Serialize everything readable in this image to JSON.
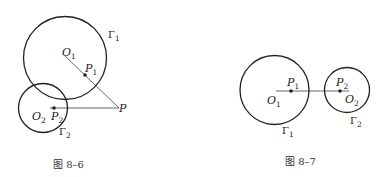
{
  "figures": [
    {
      "caption": "图 8–6",
      "labels": {
        "gamma1": "Γ",
        "gamma1_sub": "1",
        "gamma2": "Γ",
        "gamma2_sub": "2",
        "O1": "O",
        "O1_sub": "1",
        "P1": "P",
        "P1_sub": "1",
        "O2": "O",
        "O2_sub": "2",
        "P2": "P",
        "P2_sub": "2",
        "P": "P"
      }
    },
    {
      "caption": "图 8–7",
      "labels": {
        "gamma1": "Γ",
        "gamma1_sub": "1",
        "gamma2": "Γ",
        "gamma2_sub": "2",
        "O1": "O",
        "O1_sub": "1",
        "P1": "P",
        "P1_sub": "1",
        "O2": "O",
        "O2_sub": "2",
        "P2": "P",
        "P2_sub": "2"
      }
    }
  ],
  "colors": {
    "stroke": "#222222",
    "background": "#ffffff"
  }
}
